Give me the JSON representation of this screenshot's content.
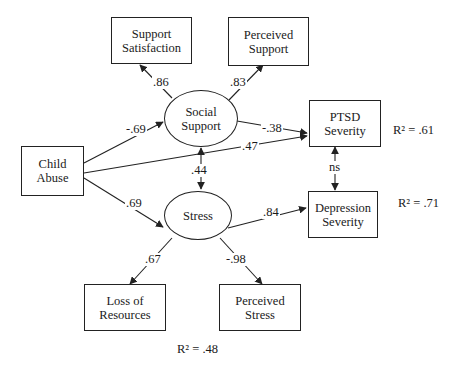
{
  "nodes": {
    "support_satisfaction": {
      "line1": "Support",
      "line2": "Satisfaction"
    },
    "perceived_support": {
      "line1": "Perceived",
      "line2": "Support"
    },
    "social_support": {
      "line1": "Social",
      "line2": "Support"
    },
    "child_abuse": {
      "line1": "Child",
      "line2": "Abuse"
    },
    "ptsd_severity": {
      "line1": "PTSD",
      "line2": "Severity"
    },
    "depression_severity": {
      "line1": "Depression",
      "line2": "Severity"
    },
    "stress": {
      "line1": "Stress"
    },
    "loss_of_resources": {
      "line1": "Loss of",
      "line2": "Resources"
    },
    "perceived_stress": {
      "line1": "Perceived",
      "line2": "Stress"
    }
  },
  "paths": {
    "social_to_satisfaction": ".86",
    "social_to_perceived_support": ".83",
    "abuse_to_social": "-.69",
    "social_to_ptsd": "-.38",
    "abuse_to_ptsd": ".47",
    "social_stress_cov": ".44",
    "abuse_to_stress": ".69",
    "stress_to_depression": ".84",
    "ptsd_depression_cov": "ns",
    "stress_to_loss": ".67",
    "stress_to_perceived_stress": "-.98"
  },
  "r_squared": {
    "ptsd": "R² = .61",
    "depression": "R² = .71",
    "stress": "R² = .48"
  },
  "colors": {
    "line": "#222222",
    "background": "#ffffff"
  }
}
